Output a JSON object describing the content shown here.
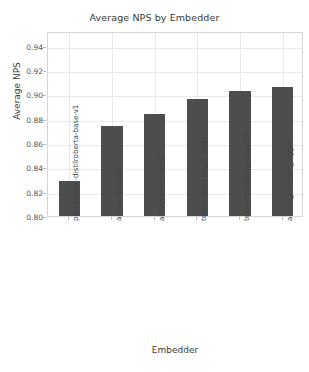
{
  "chart_data": {
    "type": "bar",
    "title": "Average NPS by Embedder",
    "xlabel": "Embedder",
    "ylabel": "Average NPS",
    "categories": [
      "paraphrase-distilroberta-base-v1",
      "anime_encoder",
      "all-mpnet-base-v2",
      "text-embedding-3-large",
      "text-embedding-ada-002",
      "anime_encoder_bigger"
    ],
    "values": [
      0.829,
      0.874,
      0.884,
      0.896,
      0.9025,
      0.906
    ],
    "ylim": [
      0.8,
      0.952
    ],
    "yticks": [
      0.8,
      0.82,
      0.84,
      0.86,
      0.88,
      0.9,
      0.92,
      0.94
    ],
    "ytick_labels": [
      "0.80",
      "0.82",
      "0.84",
      "0.86",
      "0.88",
      "0.90",
      "0.92",
      "0.94"
    ],
    "grid": true,
    "legend": false,
    "bar_color": "#4d4d4d",
    "grid_color": "#e9e9e9",
    "background": "#ffffff"
  }
}
